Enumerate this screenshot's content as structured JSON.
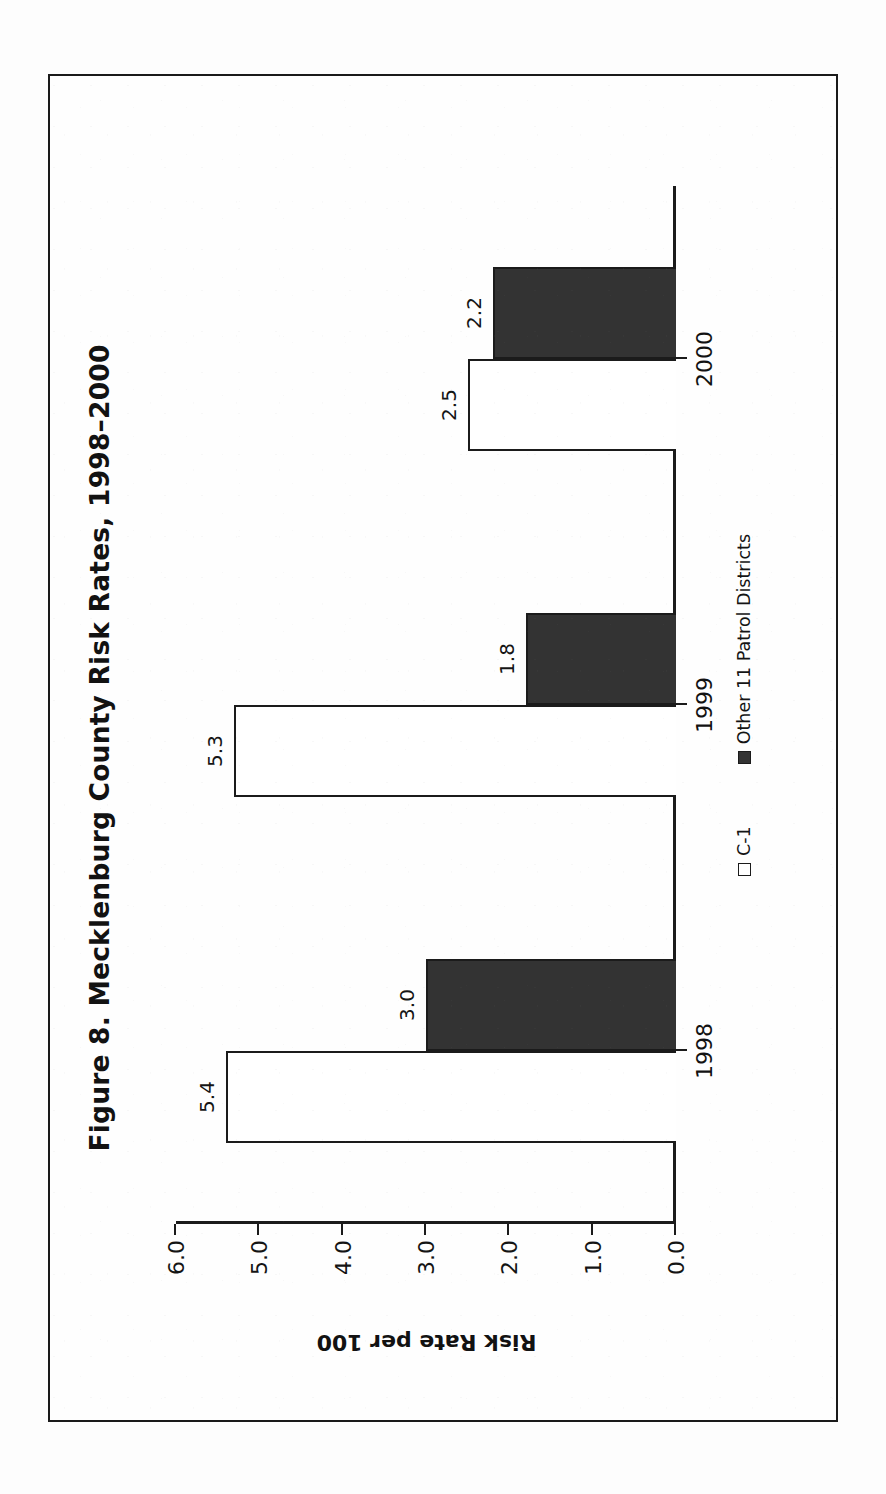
{
  "figure": {
    "title": "Figure 8. Mecklenburg County Risk Rates, 1998–2000",
    "y_axis_title": "Risk Rate per 100"
  },
  "chart_data": {
    "type": "bar",
    "title": "Figure 8. Mecklenburg County Risk Rates, 1998–2000",
    "xlabel": "",
    "ylabel": "Risk Rate per 100",
    "ylim": [
      0.0,
      6.0
    ],
    "yticks": [
      "0.0",
      "1.0",
      "2.0",
      "3.0",
      "4.0",
      "5.0",
      "6.0"
    ],
    "ytick_values": [
      0.0,
      1.0,
      2.0,
      3.0,
      4.0,
      5.0,
      6.0
    ],
    "grid": false,
    "orientation": "vertical",
    "legend_position": "bottom",
    "categories": [
      "1998",
      "1999",
      "2000"
    ],
    "series": [
      {
        "name": "C-1",
        "color": "#ffffff",
        "values": [
          5.4,
          5.3,
          2.5
        ],
        "labels": [
          "5.4",
          "5.3",
          "2.5"
        ]
      },
      {
        "name": "Other 11 Patrol Districts",
        "color": "#333333",
        "values": [
          3.0,
          1.8,
          2.2
        ],
        "labels": [
          "3.0",
          "1.8",
          "2.2"
        ]
      }
    ]
  },
  "colors": {
    "series_a": "#ffffff",
    "series_b": "#333333",
    "ink": "#1b1b1b",
    "page": "#ffffff"
  }
}
